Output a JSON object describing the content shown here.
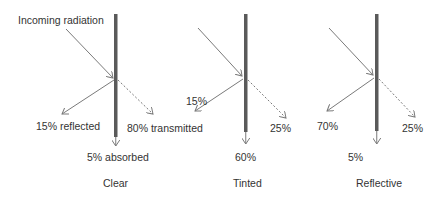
{
  "colors": {
    "glass": "#5a5a5a",
    "arrow": "#7a7a7a",
    "text": "#333333",
    "background": "#ffffff"
  },
  "incoming_label": "Incoming radiation",
  "panels": [
    {
      "name": "Clear",
      "reflected": "15% reflected",
      "transmitted": "80% transmitted",
      "absorbed": "5% absorbed"
    },
    {
      "name": "Tinted",
      "reflected": "15%",
      "transmitted": "25%",
      "absorbed": "60%"
    },
    {
      "name": "Reflective",
      "reflected": "70%",
      "transmitted": "25%",
      "absorbed": "5%"
    }
  ]
}
